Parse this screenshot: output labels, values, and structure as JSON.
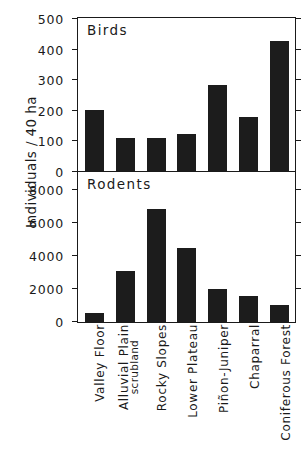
{
  "axis": {
    "ylabel": "Individuals / 40 ha"
  },
  "categories": [
    "Valley Floor",
    "Alluvial Plain scrubland",
    "Rocky Slopes",
    "Lower Plateau",
    "Piñon-Juniper",
    "Chaparral",
    "Coniferous Forest"
  ],
  "category_lines": [
    {
      "l1": "Valley Floor",
      "l2": ""
    },
    {
      "l1": "Alluvial Plain",
      "l2": "scrubland"
    },
    {
      "l1": "Rocky Slopes",
      "l2": ""
    },
    {
      "l1": "Lower Plateau",
      "l2": ""
    },
    {
      "l1": "Piñon-Juniper",
      "l2": ""
    },
    {
      "l1": "Chaparral",
      "l2": ""
    },
    {
      "l1": "Coniferous Forest",
      "l2": ""
    }
  ],
  "panels": {
    "birds": {
      "title": "Birds",
      "ticks": [
        "500",
        "400",
        "300",
        "200",
        "100",
        "0"
      ]
    },
    "rodents": {
      "title": "Rodents",
      "ticks": [
        "8000",
        "6000",
        "4000",
        "2000",
        "0"
      ]
    }
  },
  "colors": {
    "bar": "#1c1c1c",
    "axis": "#1a1a1a",
    "background": "#ffffff"
  },
  "chart_data": [
    {
      "type": "bar",
      "title": "Birds",
      "xlabel": "",
      "ylabel": "Individuals / 40 ha",
      "ylim": [
        0,
        500
      ],
      "yticks": [
        0,
        100,
        200,
        300,
        400,
        500
      ],
      "grid": false,
      "legend": "none",
      "categories": [
        "Valley Floor",
        "Alluvial Plain scrubland",
        "Rocky Slopes",
        "Lower Plateau",
        "Piñon-Juniper",
        "Chaparral",
        "Coniferous Forest"
      ],
      "values": [
        200,
        108,
        107,
        120,
        282,
        178,
        425
      ]
    },
    {
      "type": "bar",
      "title": "Rodents",
      "xlabel": "",
      "ylabel": "Individuals / 40 ha",
      "ylim": [
        0,
        9000
      ],
      "yticks": [
        0,
        2000,
        4000,
        6000,
        8000
      ],
      "grid": false,
      "legend": "none",
      "categories": [
        "Valley Floor",
        "Alluvial Plain scrubland",
        "Rocky Slopes",
        "Lower Plateau",
        "Piñon-Juniper",
        "Chaparral",
        "Coniferous Forest"
      ],
      "values": [
        550,
        3100,
        6800,
        4450,
        2000,
        1600,
        1000
      ]
    }
  ]
}
